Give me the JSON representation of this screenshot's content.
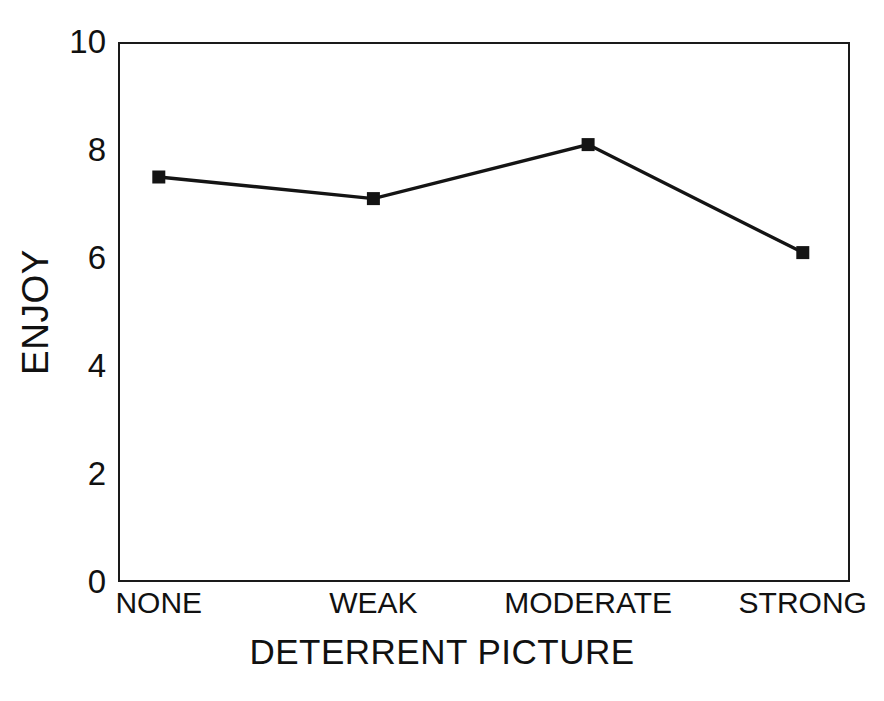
{
  "chart_data": {
    "type": "line",
    "title": "",
    "xlabel": "DETERRENT PICTURE",
    "ylabel": "ENJOY",
    "categories": [
      "NONE",
      "WEAK",
      "MODERATE",
      "STRONG"
    ],
    "values": [
      7.5,
      7.1,
      8.1,
      6.1
    ],
    "series": [
      {
        "name": "ENJOY",
        "values": [
          7.5,
          7.1,
          8.1,
          6.1
        ]
      }
    ],
    "ylim": [
      0,
      10
    ],
    "yticks": [
      0,
      2,
      4,
      6,
      8,
      10
    ],
    "ytick_labels": [
      "0",
      "2",
      "4",
      "6",
      "8",
      "10"
    ],
    "grid": false,
    "legend": false,
    "legend_position": "none",
    "marker": "filled-square",
    "line_color": "#141414",
    "marker_color": "#141414",
    "background_color": "#ffffff",
    "axis_color": "#1a1a1a"
  }
}
